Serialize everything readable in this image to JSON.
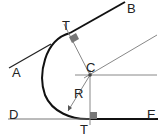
{
  "diagram": {
    "labels": {
      "A": "A",
      "B": "B",
      "C": "C",
      "D": "D",
      "E": "E",
      "R": "R",
      "T_top": "T",
      "T_bottom": "T"
    },
    "colors": {
      "line": "#111111",
      "construction": "#777777",
      "marker": "#777777"
    }
  }
}
